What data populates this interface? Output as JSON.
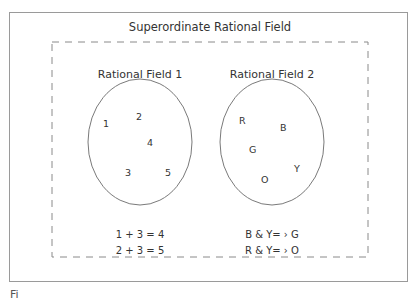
{
  "diagram": {
    "title": "Superordinate Rational Field",
    "fields": [
      {
        "title": "Rational Field 1",
        "elements": [
          {
            "label": "1",
            "x": 103,
            "y": 118
          },
          {
            "label": "2",
            "x": 136,
            "y": 111
          },
          {
            "label": "4",
            "x": 147,
            "y": 137
          },
          {
            "label": "3",
            "x": 125,
            "y": 167
          },
          {
            "label": "5",
            "x": 165,
            "y": 167
          }
        ],
        "equations": [
          "1 + 3 = 4",
          "2 + 3 = 5"
        ]
      },
      {
        "title": "Rational Field 2",
        "elements": [
          {
            "label": "R",
            "x": 239,
            "y": 115
          },
          {
            "label": "B",
            "x": 280,
            "y": 122
          },
          {
            "label": "G",
            "x": 249,
            "y": 144
          },
          {
            "label": "Y",
            "x": 294,
            "y": 163
          },
          {
            "label": "O",
            "x": 261,
            "y": 174
          }
        ],
        "equations": [
          "B & Y= › G",
          "R & Y= › O"
        ]
      }
    ],
    "caption_fragment": "Fi"
  },
  "colors": {
    "line": "#7a7a7a",
    "text": "#333333"
  }
}
